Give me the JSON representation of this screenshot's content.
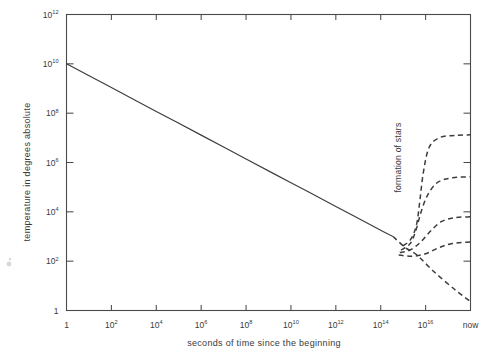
{
  "figure": {
    "background_color": "#ffffff",
    "ink_color": "#3c3c3c"
  },
  "chart_data": {
    "type": "line",
    "title": "",
    "subtitle": "",
    "xlabel": "seconds of time since the beginning",
    "ylabel": "temperature in  degrees absolute",
    "xscale": "log",
    "yscale": "log",
    "grid": false,
    "legend": null,
    "xlim": [
      0,
      18
    ],
    "ylim": [
      0,
      12
    ],
    "x_tick_labels": [
      "1",
      "10²",
      "10⁴",
      "10⁶",
      "10⁸",
      "10¹⁰",
      "10¹²",
      "10¹⁴",
      "10¹⁶",
      "now"
    ],
    "x_tick_bases": [
      "1",
      "10",
      "10",
      "10",
      "10",
      "10",
      "10",
      "10",
      "10",
      "now"
    ],
    "x_tick_exponents": [
      "",
      "2",
      "4",
      "6",
      "8",
      "10",
      "12",
      "14",
      "16",
      ""
    ],
    "x_tick_exp_values": [
      0,
      2,
      4,
      6,
      8,
      10,
      12,
      14,
      16,
      18
    ],
    "y_tick_labels": [
      "10¹²",
      "10¹⁰",
      "10⁸",
      "10⁶",
      "10⁴",
      "10²",
      "1"
    ],
    "y_tick_bases": [
      "10",
      "10",
      "10",
      "10",
      "10",
      "10",
      "1"
    ],
    "y_tick_exponents": [
      "12",
      "10",
      "8",
      "6",
      "4",
      "2",
      ""
    ],
    "y_tick_exp_values": [
      12,
      10,
      8,
      6,
      4,
      2,
      0
    ],
    "annotations": [
      {
        "text": "formation of stars",
        "orientation": "vertical",
        "x_exp": 14.9,
        "y_exp": 6.2
      }
    ],
    "series": [
      {
        "name": "cosmic background temperature (early, solid)",
        "style": "solid",
        "points": [
          {
            "x_exp": 0.0,
            "y_exp": 10.0
          },
          {
            "x_exp": 2.0,
            "y_exp": 9.04
          },
          {
            "x_exp": 4.0,
            "y_exp": 8.07
          },
          {
            "x_exp": 6.0,
            "y_exp": 7.11
          },
          {
            "x_exp": 8.0,
            "y_exp": 6.14
          },
          {
            "x_exp": 10.0,
            "y_exp": 5.18
          },
          {
            "x_exp": 12.0,
            "y_exp": 4.22
          },
          {
            "x_exp": 14.0,
            "y_exp": 3.25
          },
          {
            "x_exp": 14.55,
            "y_exp": 3.0
          }
        ]
      },
      {
        "name": "cosmic background temperature (continuing, dashed)",
        "style": "dashed",
        "points": [
          {
            "x_exp": 14.55,
            "y_exp": 3.0
          },
          {
            "x_exp": 15.1,
            "y_exp": 2.55
          },
          {
            "x_exp": 15.6,
            "y_exp": 2.26
          },
          {
            "x_exp": 16.4,
            "y_exp": 1.55
          },
          {
            "x_exp": 17.3,
            "y_exp": 0.85
          },
          {
            "x_exp": 18.0,
            "y_exp": 0.36
          }
        ]
      },
      {
        "name": "star interior branch 1 (hottest)",
        "style": "dashed",
        "points": [
          {
            "x_exp": 15.0,
            "y_exp": 2.62
          },
          {
            "x_exp": 15.35,
            "y_exp": 2.9
          },
          {
            "x_exp": 15.6,
            "y_exp": 3.5
          },
          {
            "x_exp": 15.75,
            "y_exp": 4.5
          },
          {
            "x_exp": 15.9,
            "y_exp": 5.6
          },
          {
            "x_exp": 16.15,
            "y_exp": 6.6
          },
          {
            "x_exp": 16.6,
            "y_exp": 7.0
          },
          {
            "x_exp": 17.3,
            "y_exp": 7.1
          },
          {
            "x_exp": 18.0,
            "y_exp": 7.12
          }
        ]
      },
      {
        "name": "star interior branch 2",
        "style": "dashed",
        "points": [
          {
            "x_exp": 14.9,
            "y_exp": 2.45
          },
          {
            "x_exp": 15.3,
            "y_exp": 2.7
          },
          {
            "x_exp": 15.55,
            "y_exp": 3.2
          },
          {
            "x_exp": 15.8,
            "y_exp": 4.0
          },
          {
            "x_exp": 16.1,
            "y_exp": 4.7
          },
          {
            "x_exp": 16.55,
            "y_exp": 5.2
          },
          {
            "x_exp": 17.2,
            "y_exp": 5.38
          },
          {
            "x_exp": 18.0,
            "y_exp": 5.42
          }
        ]
      },
      {
        "name": "star interior branch 3",
        "style": "dashed",
        "points": [
          {
            "x_exp": 14.85,
            "y_exp": 2.35
          },
          {
            "x_exp": 15.3,
            "y_exp": 2.45
          },
          {
            "x_exp": 15.75,
            "y_exp": 2.75
          },
          {
            "x_exp": 16.2,
            "y_exp": 3.2
          },
          {
            "x_exp": 16.7,
            "y_exp": 3.6
          },
          {
            "x_exp": 17.3,
            "y_exp": 3.76
          },
          {
            "x_exp": 18.0,
            "y_exp": 3.8
          }
        ]
      },
      {
        "name": "star interior branch 4 (coolest)",
        "style": "dashed",
        "points": [
          {
            "x_exp": 14.8,
            "y_exp": 2.25
          },
          {
            "x_exp": 15.4,
            "y_exp": 2.2
          },
          {
            "x_exp": 16.0,
            "y_exp": 2.3
          },
          {
            "x_exp": 16.6,
            "y_exp": 2.55
          },
          {
            "x_exp": 17.2,
            "y_exp": 2.72
          },
          {
            "x_exp": 18.0,
            "y_exp": 2.78
          }
        ]
      }
    ]
  }
}
